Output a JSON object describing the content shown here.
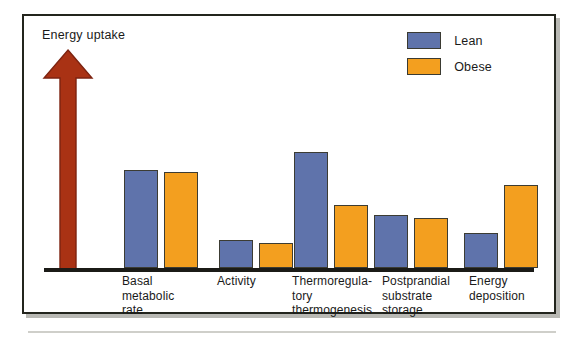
{
  "figure": {
    "y_axis_label": "Energy uptake",
    "arrow_icon": "up-arrow-icon",
    "frame_color": "#23251d",
    "background_color": "#ffffff"
  },
  "legend": {
    "position": "top-right",
    "entries": [
      {
        "label": "Lean",
        "color": "#5f73ab",
        "swatch_icon": "legend-swatch-lean"
      },
      {
        "label": "Obese",
        "color": "#f39f1f",
        "swatch_icon": "legend-swatch-obese"
      }
    ]
  },
  "colors": {
    "lean": "#5f73ab",
    "obese": "#f39f1f",
    "arrow": "#a93214",
    "axis": "#1b1b17",
    "bar_outline": "#3c3c33"
  },
  "chart_data": {
    "type": "bar",
    "title": "",
    "subtitle": "",
    "xlabel": "",
    "ylabel": "Energy uptake",
    "grid": false,
    "legend_position": "top-right",
    "axis_style": "arrow-only-qualitative",
    "ylim": [
      0,
      100
    ],
    "y_ticks": [],
    "y_tick_labels": [],
    "categories": [
      "Basal\nmetabolic\nrate",
      "Activity",
      "Thermoregula-\ntory\nthermogenesis",
      "Postprandial\nsubstrate\nstorage",
      "Energy\ndeposition"
    ],
    "categories_flat": [
      "Basal metabolic rate",
      "Activity",
      "Thermoregulatory thermogenesis",
      "Postprandial substrate storage",
      "Energy deposition"
    ],
    "series": [
      {
        "name": "Lean",
        "color": "#5f73ab",
        "values": [
          39,
          11,
          46,
          21,
          14
        ]
      },
      {
        "name": "Obese",
        "color": "#f39f1f",
        "values": [
          38,
          10,
          25,
          20,
          33
        ]
      }
    ],
    "annotations": [
      {
        "text": "Energy uptake",
        "type": "axis-arrow-label",
        "position": "top-left"
      }
    ]
  },
  "layout": {
    "bar_width_px": 34,
    "bar_gap_px": 6,
    "plot_height_px": 252,
    "group_left_offsets_px": [
      80,
      175,
      250,
      330,
      420
    ]
  }
}
